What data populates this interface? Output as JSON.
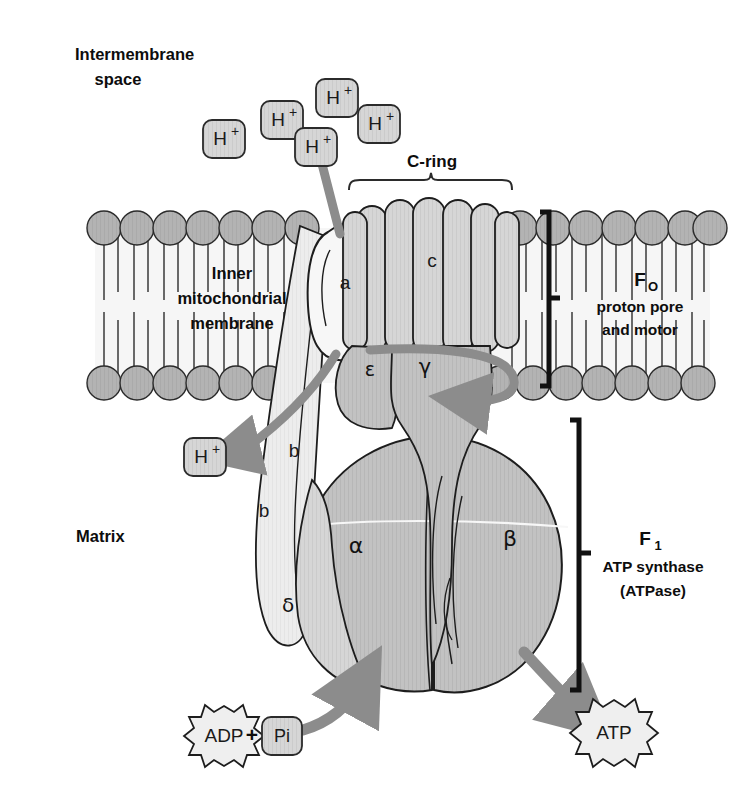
{
  "figure": {
    "background_color": "#ffffff"
  },
  "colors": {
    "ink": "#0d0d0d",
    "outline": "#1d1d1d",
    "membrane_head": "#b3b3b3",
    "membrane_band": "#f4f4f4",
    "subunit_light": "#f2f2f2",
    "subunit_mid": "#c2c2c2",
    "subunit_dark": "#a8a8a8",
    "arrow_gray": "#8c8c8c",
    "proton_box_fill": "#c9c9c9",
    "starburst_fill": "#efefef"
  },
  "compartments": {
    "top_label_line1": "Intermembrane",
    "top_label_line2": "space",
    "bottom_label": "Matrix"
  },
  "membrane": {
    "label_line1": "Inner",
    "label_line2": "mitochondrial",
    "label_line3": "membrane"
  },
  "protons": {
    "symbol": "H",
    "charge": "+",
    "intermembrane_count": 5,
    "matrix_count": 1,
    "intermembrane_positions": [
      {
        "x": 224,
        "y": 139
      },
      {
        "x": 282,
        "y": 120
      },
      {
        "x": 337,
        "y": 98
      },
      {
        "x": 316,
        "y": 147
      },
      {
        "x": 379,
        "y": 124
      }
    ],
    "matrix_positions": [
      {
        "x": 205,
        "y": 457
      }
    ]
  },
  "brackets": {
    "c_ring": {
      "label": "C-ring",
      "label_x": 432,
      "label_y": 163,
      "left_x": 349,
      "right_x": 512,
      "y": 184
    },
    "fo": {
      "label_main": "F",
      "label_sub": "O",
      "label_line2": "proton pore",
      "label_line3": "and motor",
      "x": 549,
      "top_y": 212,
      "bottom_y": 386
    },
    "f1": {
      "label_main": "F",
      "label_sub": "1",
      "label_line2": "ATP synthase",
      "label_line3": "(ATPase)",
      "x": 579,
      "top_y": 420,
      "bottom_y": 690
    }
  },
  "subunits": [
    {
      "name": "a",
      "glyph": "a",
      "x": 345,
      "y": 284,
      "kind": "latin"
    },
    {
      "name": "c",
      "glyph": "c",
      "x": 432,
      "y": 262,
      "kind": "latin"
    },
    {
      "name": "b-top",
      "glyph": "b",
      "x": 294,
      "y": 452,
      "kind": "latin"
    },
    {
      "name": "b-bot",
      "glyph": "b",
      "x": 264,
      "y": 512,
      "kind": "latin"
    },
    {
      "name": "delta",
      "glyph": "δ",
      "x": 288,
      "y": 606,
      "kind": "greek"
    },
    {
      "name": "epsilon",
      "glyph": "ε",
      "x": 370,
      "y": 370,
      "kind": "greek"
    },
    {
      "name": "gamma",
      "glyph": "γ",
      "x": 425,
      "y": 368,
      "kind": "greek"
    },
    {
      "name": "alpha",
      "glyph": "α",
      "x": 356,
      "y": 547,
      "kind": "greek"
    },
    {
      "name": "beta",
      "glyph": "β",
      "x": 510,
      "y": 540,
      "kind": "greek"
    }
  ],
  "reaction": {
    "substrate_adp": "ADP",
    "plus_sign": "+",
    "substrate_pi": "Pi",
    "product_atp": "ATP",
    "adp_center": {
      "x": 224,
      "y": 736
    },
    "pi_center": {
      "x": 281,
      "y": 736
    },
    "plus_position": {
      "x": 252,
      "y": 735
    },
    "atp_center": {
      "x": 614,
      "y": 735
    }
  },
  "arrows": {
    "proton_in": "proton entry through subunit a",
    "proton_out": "proton exit to matrix",
    "rotation": "c-ring / gamma rotation",
    "substrate_in": "ADP + Pi entry arrow",
    "product_out": "ATP release arrow"
  }
}
